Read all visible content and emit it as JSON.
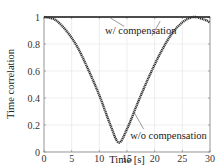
{
  "chart_data": {
    "type": "line",
    "title": "",
    "xlabel": "Time [s]",
    "ylabel": "Time correlation",
    "xlim": [
      0,
      30
    ],
    "ylim": [
      0,
      1
    ],
    "xticks": [
      0,
      5,
      10,
      15,
      20,
      25,
      30
    ],
    "yticks": [
      0,
      0.2,
      0.4,
      0.6,
      0.8,
      1
    ],
    "ytick_labels": [
      "0",
      "0.2",
      "0.4",
      "0.6",
      "0.8",
      "1"
    ],
    "grid": true,
    "series": [
      {
        "name": "w/ compensation",
        "x": [
          0,
          5,
          10,
          15,
          20,
          25,
          30
        ],
        "values": [
          1,
          1,
          1,
          1,
          1,
          1,
          1
        ]
      },
      {
        "name": "w/o compensation",
        "x": [
          0,
          2,
          4,
          6,
          8,
          10,
          12,
          13.5,
          15,
          17,
          19,
          21,
          23,
          25,
          27,
          29,
          30
        ],
        "values": [
          1.0,
          0.98,
          0.9,
          0.78,
          0.61,
          0.42,
          0.2,
          0.07,
          0.17,
          0.37,
          0.56,
          0.73,
          0.87,
          0.96,
          1.0,
          0.98,
          0.96
        ]
      }
    ],
    "annotations": [
      {
        "text": "w/ compensation",
        "x": 17.5,
        "y": 0.9,
        "arrow_to": [
          12,
          1.0
        ]
      },
      {
        "text": "w/o compensation",
        "x": 22.5,
        "y": 0.12,
        "arrow_to": [
          16.5,
          0.3
        ]
      }
    ]
  }
}
